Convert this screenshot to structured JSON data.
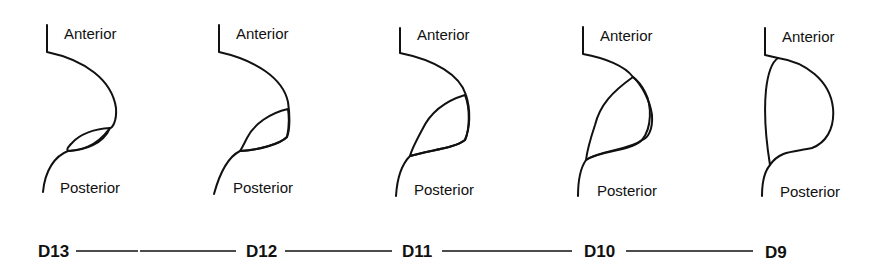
{
  "diagram": {
    "type": "sequential anatomical profile series",
    "panels": [
      {
        "stage": "D13",
        "top_label": "Anterior",
        "bottom_label": "Posterior",
        "shaded_extent": "small"
      },
      {
        "stage": "D12",
        "top_label": "Anterior",
        "bottom_label": "Posterior",
        "shaded_extent": "small-medium"
      },
      {
        "stage": "D11",
        "top_label": "Anterior",
        "bottom_label": "Posterior",
        "shaded_extent": "medium"
      },
      {
        "stage": "D10",
        "top_label": "Anterior",
        "bottom_label": "Posterior",
        "shaded_extent": "large"
      },
      {
        "stage": "D9",
        "top_label": "Anterior",
        "bottom_label": "Posterior",
        "shaded_extent": "full"
      }
    ],
    "timeline": [
      "D13",
      "D12",
      "D11",
      "D10",
      "D9"
    ],
    "colors": {
      "ink": "#111111",
      "background": "#ffffff"
    }
  }
}
